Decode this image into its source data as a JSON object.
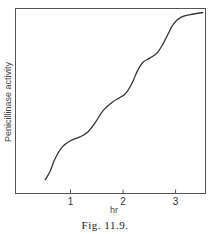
{
  "chart_data": {
    "type": "line",
    "title": "",
    "caption": "Fig. 11.9.",
    "xlabel": "hr",
    "ylabel": "Penicillinase activity",
    "xlim": [
      0,
      3.56
    ],
    "ylim": [
      0,
      100
    ],
    "xticks": [
      1,
      2,
      3
    ],
    "xtick_labels": [
      "1",
      "2",
      "3"
    ],
    "yticks": [],
    "grid": false,
    "legend": null,
    "series": [
      {
        "name": "Penicillinase activity",
        "x": [
          0.52,
          0.61,
          0.7,
          0.84,
          0.99,
          1.18,
          1.33,
          1.47,
          1.62,
          1.79,
          1.94,
          2.05,
          2.17,
          2.28,
          2.38,
          2.51,
          2.65,
          2.76,
          2.86,
          2.95,
          3.09,
          3.28,
          3.52
        ],
        "y": [
          7.5,
          11.9,
          18.5,
          25.1,
          28.4,
          30.6,
          33.3,
          38.3,
          44.8,
          49.2,
          51.9,
          54.1,
          59.6,
          66.7,
          71.0,
          73.2,
          76.0,
          80.9,
          86.3,
          91.3,
          95.1,
          96.7,
          97.8
        ]
      }
    ]
  }
}
